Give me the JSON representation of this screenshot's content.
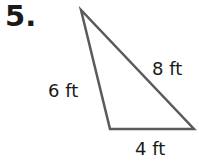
{
  "problem": {
    "number": "5."
  },
  "triangle": {
    "sides": [
      {
        "label": "6 ft"
      },
      {
        "label": "8 ft"
      },
      {
        "label": "4 ft"
      }
    ],
    "stroke_color": "#5a5a5a"
  }
}
